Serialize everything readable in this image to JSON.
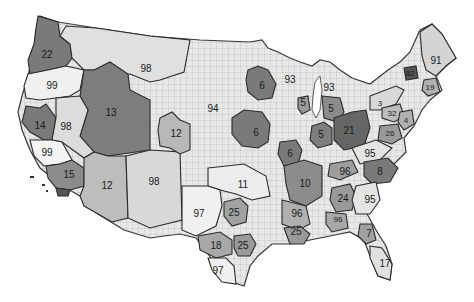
{
  "map": {
    "title": "",
    "description": "Grayscale map of the contiguous United States showing county boundaries grouped into numbered regions",
    "colors": {
      "background": "#ffffff",
      "light": "#e6e6e6",
      "lighter": "#f2f2f2",
      "medium": "#bdbdbd",
      "dark": "#7d7d7d",
      "darker": "#666666",
      "border": "#2a2a2a",
      "county_line": "#a0a0a0"
    },
    "labels": [
      {
        "id": "r22",
        "text": "22",
        "x": 47,
        "y": 55
      },
      {
        "id": "r99a",
        "text": "99",
        "x": 52,
        "y": 86
      },
      {
        "id": "r98a",
        "text": "98",
        "x": 146,
        "y": 69
      },
      {
        "id": "r13",
        "text": "13",
        "x": 111,
        "y": 113
      },
      {
        "id": "r14",
        "text": "14",
        "x": 40,
        "y": 126
      },
      {
        "id": "r98b",
        "text": "98",
        "x": 66,
        "y": 127
      },
      {
        "id": "r99b",
        "text": "99",
        "x": 47,
        "y": 153
      },
      {
        "id": "r15",
        "text": "15",
        "x": 69,
        "y": 175
      },
      {
        "id": "r12a",
        "text": "12",
        "x": 107,
        "y": 186
      },
      {
        "id": "r98c",
        "text": "98",
        "x": 154,
        "y": 182
      },
      {
        "id": "r12b",
        "text": "12",
        "x": 176,
        "y": 134
      },
      {
        "id": "r94",
        "text": "94",
        "x": 213,
        "y": 109
      },
      {
        "id": "r6a",
        "text": "6",
        "x": 262,
        "y": 86
      },
      {
        "id": "r6b",
        "text": "6",
        "x": 256,
        "y": 133
      },
      {
        "id": "r6c",
        "text": "6",
        "x": 290,
        "y": 154
      },
      {
        "id": "r93a",
        "text": "93",
        "x": 290,
        "y": 80
      },
      {
        "id": "r93b",
        "text": "93",
        "x": 329,
        "y": 88
      },
      {
        "id": "r5a",
        "text": "5",
        "x": 303,
        "y": 103
      },
      {
        "id": "r5b",
        "text": "5",
        "x": 331,
        "y": 109
      },
      {
        "id": "r5c",
        "text": "5",
        "x": 321,
        "y": 135
      },
      {
        "id": "r21",
        "text": "21",
        "x": 349,
        "y": 131
      },
      {
        "id": "r3",
        "text": "3",
        "x": 380,
        "y": 104
      },
      {
        "id": "r32",
        "text": "32",
        "x": 392,
        "y": 114
      },
      {
        "id": "r4",
        "text": "4",
        "x": 406,
        "y": 121
      },
      {
        "id": "r26",
        "text": "26",
        "x": 390,
        "y": 134
      },
      {
        "id": "r91",
        "text": "91",
        "x": 436,
        "y": 61
      },
      {
        "id": "r82",
        "text": "82",
        "x": 410,
        "y": 74
      },
      {
        "id": "r19",
        "text": "19",
        "x": 430,
        "y": 88
      },
      {
        "id": "r11",
        "text": "11",
        "x": 243,
        "y": 185
      },
      {
        "id": "r10",
        "text": "10",
        "x": 305,
        "y": 184
      },
      {
        "id": "r95a",
        "text": "95",
        "x": 370,
        "y": 154
      },
      {
        "id": "r96a",
        "text": "96",
        "x": 345,
        "y": 172
      },
      {
        "id": "r8",
        "text": "8",
        "x": 380,
        "y": 172
      },
      {
        "id": "r24",
        "text": "24",
        "x": 343,
        "y": 199
      },
      {
        "id": "r95b",
        "text": "95",
        "x": 370,
        "y": 200
      },
      {
        "id": "r96b",
        "text": "96",
        "x": 297,
        "y": 214
      },
      {
        "id": "r96c",
        "text": "96",
        "x": 338,
        "y": 220
      },
      {
        "id": "r97a",
        "text": "97",
        "x": 199,
        "y": 214
      },
      {
        "id": "r25a",
        "text": "25",
        "x": 234,
        "y": 213
      },
      {
        "id": "r25b",
        "text": "25",
        "x": 296,
        "y": 232
      },
      {
        "id": "r18",
        "text": "18",
        "x": 216,
        "y": 246
      },
      {
        "id": "r25c",
        "text": "25",
        "x": 243,
        "y": 246
      },
      {
        "id": "r97b",
        "text": "97",
        "x": 218,
        "y": 271
      },
      {
        "id": "r7",
        "text": "7",
        "x": 369,
        "y": 234
      },
      {
        "id": "r17",
        "text": "17",
        "x": 385,
        "y": 264
      }
    ]
  }
}
